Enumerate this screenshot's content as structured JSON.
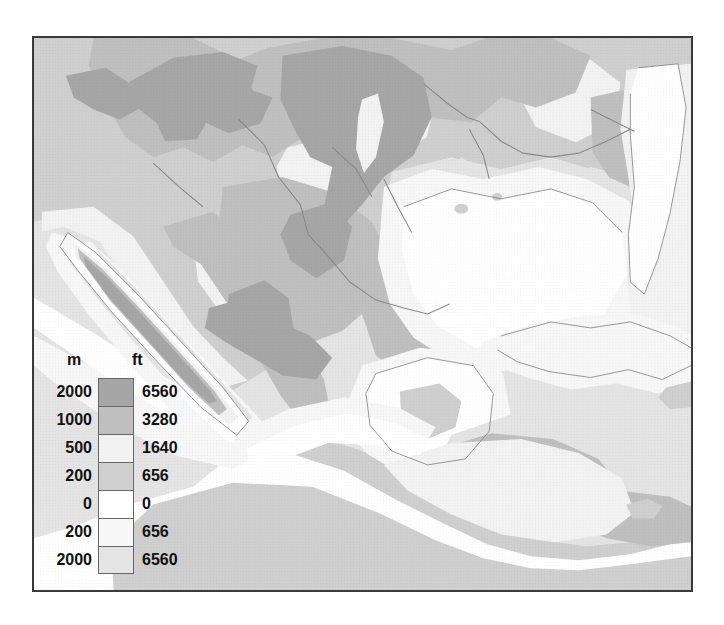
{
  "map": {
    "title": "Physical relief map of Mexico, Central America and the Caribbean",
    "frame_border_color": "#3a3a3a",
    "background_color": "#ffffff"
  },
  "legend": {
    "header_m": "m",
    "header_ft": "ft",
    "rows": [
      {
        "m": "2000",
        "ft": "6560",
        "color": "#a6a6a6",
        "band": "land-above-2000m"
      },
      {
        "m": "1000",
        "ft": "3280",
        "color": "#bfbfbf",
        "band": "land-1000-2000m"
      },
      {
        "m": "500",
        "ft": "1640",
        "color": "#f2f2f2",
        "band": "land-500-1000m"
      },
      {
        "m": "200",
        "ft": "656",
        "color": "#cfcfcf",
        "band": "land-200-500m"
      },
      {
        "m": "0",
        "ft": "0",
        "color": "#ffffff",
        "band": "land-0-200m"
      },
      {
        "m": "200",
        "ft": "656",
        "color": "#f7f7f7",
        "band": "sea-0-200m"
      },
      {
        "m": "2000",
        "ft": "6560",
        "color": "#e4e4e4",
        "band": "sea-below-2000m"
      }
    ]
  },
  "chart_data": {
    "type": "map",
    "projection_note": "hypsometric / bathymetric tinted relief",
    "elevation_bands_m": [
      2000,
      1000,
      500,
      200,
      0
    ],
    "depth_bands_m": [
      200,
      2000
    ],
    "elevation_bands_ft": [
      6560,
      3280,
      1640,
      656,
      0
    ],
    "depth_bands_ft": [
      656,
      6560
    ],
    "palette": {
      "above_2000m": "#a6a6a6",
      "m1000_2000": "#bfbfbf",
      "m500_1000": "#f2f2f2",
      "m200_500": "#cfcfcf",
      "m0_200": "#ffffff",
      "sea_0_200m": "#f7f7f7",
      "sea_deep": "#e4e4e4",
      "rivers": "#8a8a8a",
      "coastline": "#6f6f6f"
    },
    "regions": [
      "Sierra Madre Occidental",
      "Sierra Madre Oriental",
      "Mexican Plateau",
      "Baja California Peninsula",
      "Gulf of California",
      "Gulf of Mexico",
      "Yucatan Peninsula",
      "Florida Peninsula",
      "Cuba",
      "Caribbean Sea",
      "Central American Cordillera",
      "Pacific Ocean"
    ]
  }
}
